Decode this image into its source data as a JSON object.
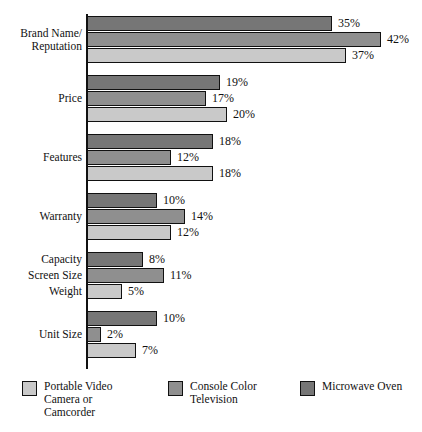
{
  "chart_data": {
    "type": "bar",
    "orientation": "horizontal",
    "title": "",
    "subtitle": "",
    "xlabel": "",
    "ylabel": "",
    "xlim": [
      0,
      45
    ],
    "grid": false,
    "legend_position": "bottom",
    "value_suffix": "%",
    "categories": [
      "Brand Name/\nReputation",
      "Price",
      "Features",
      "Warranty",
      "Capacity / Screen Size / Weight",
      "Unit Size"
    ],
    "series": [
      {
        "name": "Portable Video Camera or Camcorder",
        "color": "#c9c9c9",
        "values": [
          37,
          20,
          18,
          12,
          5,
          7
        ]
      },
      {
        "name": "Console Color Television",
        "color": "#8f8f8f",
        "values": [
          42,
          17,
          12,
          14,
          11,
          2
        ]
      },
      {
        "name": "Microwave Oven",
        "color": "#767676",
        "values": [
          35,
          19,
          18,
          10,
          8,
          10
        ]
      }
    ],
    "groups": [
      {
        "label": "Brand Name/\nReputation",
        "per_bar_labels": null,
        "bars": [
          {
            "series": "Microwave Oven",
            "value": 35,
            "value_label": "35%"
          },
          {
            "series": "Console Color Television",
            "value": 42,
            "value_label": "42%"
          },
          {
            "series": "Portable Video Camera or Camcorder",
            "value": 37,
            "value_label": "37%"
          }
        ]
      },
      {
        "label": "Price",
        "per_bar_labels": null,
        "bars": [
          {
            "series": "Microwave Oven",
            "value": 19,
            "value_label": "19%"
          },
          {
            "series": "Console Color Television",
            "value": 17,
            "value_label": "17%"
          },
          {
            "series": "Portable Video Camera or Camcorder",
            "value": 20,
            "value_label": "20%"
          }
        ]
      },
      {
        "label": "Features",
        "per_bar_labels": null,
        "bars": [
          {
            "series": "Microwave Oven",
            "value": 18,
            "value_label": "18%"
          },
          {
            "series": "Console Color Television",
            "value": 12,
            "value_label": "12%"
          },
          {
            "series": "Portable Video Camera or Camcorder",
            "value": 18,
            "value_label": "18%"
          }
        ]
      },
      {
        "label": "Warranty",
        "per_bar_labels": null,
        "bars": [
          {
            "series": "Microwave Oven",
            "value": 10,
            "value_label": "10%"
          },
          {
            "series": "Console Color Television",
            "value": 14,
            "value_label": "14%"
          },
          {
            "series": "Portable Video Camera or Camcorder",
            "value": 12,
            "value_label": "12%"
          }
        ]
      },
      {
        "label": "",
        "per_bar_labels": [
          "Capacity",
          "Screen Size",
          "Weight"
        ],
        "bars": [
          {
            "series": "Microwave Oven",
            "value": 8,
            "value_label": "8%"
          },
          {
            "series": "Console Color Television",
            "value": 11,
            "value_label": "11%"
          },
          {
            "series": "Portable Video Camera or Camcorder",
            "value": 5,
            "value_label": "5%"
          }
        ]
      },
      {
        "label": "Unit Size",
        "per_bar_labels": null,
        "bars": [
          {
            "series": "Microwave Oven",
            "value": 10,
            "value_label": "10%"
          },
          {
            "series": "Console Color Television",
            "value": 2,
            "value_label": "2%"
          },
          {
            "series": "Portable Video Camera or Camcorder",
            "value": 7,
            "value_label": "7%"
          }
        ]
      }
    ]
  },
  "legend": {
    "items": [
      {
        "label": "Portable Video\nCamera or\nCamcorder",
        "color": "#c9c9c9"
      },
      {
        "label": "Console Color\nTelevision",
        "color": "#8f8f8f"
      },
      {
        "label": "Microwave Oven",
        "color": "#767676"
      }
    ]
  },
  "axis": {
    "origin_x_px": 87,
    "px_per_percent": 7
  }
}
